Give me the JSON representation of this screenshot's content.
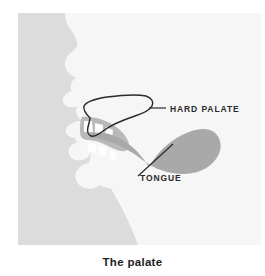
{
  "figure": {
    "caption": "The palate",
    "panel": {
      "background_color": "#dcdcdc",
      "head_fill_color": "#f6f6f6",
      "tongue_color": "#a9a9a9",
      "teeth_color": "#fdfdfd",
      "gum_color": "#b9b9b9",
      "outline_color": "#2b2b2b",
      "label_color": "#2b2b2b"
    },
    "annotations": [
      {
        "id": "hard-palate",
        "label": "HARD PALATE",
        "label_x": 152,
        "label_y": 99,
        "leader_from_x": 131,
        "leader_from_y": 95,
        "leader_to_x": 148,
        "leader_to_y": 95
      },
      {
        "id": "tongue",
        "label": "TONGUE",
        "label_x": 122,
        "label_y": 168,
        "leader_from_x": 155,
        "leader_from_y": 131,
        "leader_to_x": 120,
        "leader_to_y": 163
      }
    ],
    "structures": [
      {
        "id": "head-profile",
        "name": "head profile silhouette"
      },
      {
        "id": "hard-palate-outline",
        "name": "hard palate outline"
      },
      {
        "id": "tongue-body",
        "name": "tongue"
      },
      {
        "id": "upper-teeth",
        "name": "upper teeth"
      },
      {
        "id": "lower-teeth",
        "name": "lower teeth"
      }
    ]
  }
}
